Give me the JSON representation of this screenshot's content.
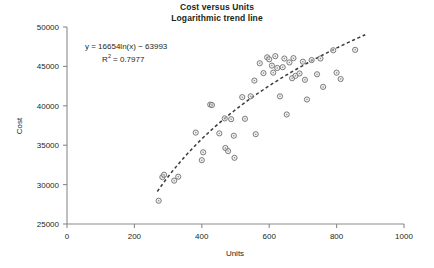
{
  "title": {
    "line1": "Cost versus Units",
    "line2": "Logarithmic trend line"
  },
  "annotation": {
    "equation": "y = 16654ln(x) − 63993",
    "r_squared": "R2 = 0.7977",
    "r_squared_base": "R",
    "r_squared_exp": "2",
    "r_squared_value": "= 0.7977"
  },
  "axes": {
    "x_label": "Units",
    "y_label": "Cost",
    "x_ticks": [
      "0",
      "200",
      "400",
      "600",
      "800",
      "1000"
    ],
    "y_ticks": [
      "25000",
      "30000",
      "35000",
      "40000",
      "45000",
      "50000"
    ]
  },
  "chart_data": {
    "type": "scatter",
    "xlabel": "Units",
    "ylabel": "Cost",
    "xlim": [
      0,
      1000
    ],
    "ylim": [
      25000,
      50000
    ],
    "xticks": [
      0,
      200,
      400,
      600,
      800,
      1000
    ],
    "yticks": [
      25000,
      30000,
      35000,
      40000,
      45000,
      50000
    ],
    "grid": false,
    "legend": false,
    "marker_style": "open-circle",
    "marker_color": "#6e6e6e",
    "trendline": {
      "type": "logarithmic",
      "equation": "y = 16654ln(x) - 63993",
      "coefficient": 16654,
      "intercept": -63993,
      "r_squared": 0.7977,
      "style": "dashed",
      "color": "#3a3a3a",
      "x_start": 268,
      "x_end": 885
    },
    "points": [
      {
        "x": 272,
        "y": 27950
      },
      {
        "x": 283,
        "y": 30950
      },
      {
        "x": 288,
        "y": 31250
      },
      {
        "x": 318,
        "y": 30500
      },
      {
        "x": 330,
        "y": 31000
      },
      {
        "x": 382,
        "y": 36600
      },
      {
        "x": 400,
        "y": 33100
      },
      {
        "x": 404,
        "y": 34100
      },
      {
        "x": 425,
        "y": 40150
      },
      {
        "x": 430,
        "y": 40100
      },
      {
        "x": 452,
        "y": 36500
      },
      {
        "x": 468,
        "y": 38400
      },
      {
        "x": 470,
        "y": 34650
      },
      {
        "x": 478,
        "y": 34250
      },
      {
        "x": 487,
        "y": 38300
      },
      {
        "x": 495,
        "y": 36200
      },
      {
        "x": 497,
        "y": 33400
      },
      {
        "x": 520,
        "y": 41100
      },
      {
        "x": 528,
        "y": 38350
      },
      {
        "x": 545,
        "y": 41200
      },
      {
        "x": 556,
        "y": 43200
      },
      {
        "x": 560,
        "y": 36400
      },
      {
        "x": 572,
        "y": 45400
      },
      {
        "x": 583,
        "y": 44150
      },
      {
        "x": 594,
        "y": 46150
      },
      {
        "x": 600,
        "y": 45900
      },
      {
        "x": 608,
        "y": 45100
      },
      {
        "x": 612,
        "y": 44200
      },
      {
        "x": 618,
        "y": 46300
      },
      {
        "x": 624,
        "y": 44800
      },
      {
        "x": 632,
        "y": 41200
      },
      {
        "x": 640,
        "y": 44900
      },
      {
        "x": 645,
        "y": 46000
      },
      {
        "x": 652,
        "y": 38900
      },
      {
        "x": 660,
        "y": 45500
      },
      {
        "x": 668,
        "y": 43500
      },
      {
        "x": 672,
        "y": 46050
      },
      {
        "x": 678,
        "y": 43800
      },
      {
        "x": 690,
        "y": 44100
      },
      {
        "x": 700,
        "y": 45600
      },
      {
        "x": 706,
        "y": 43300
      },
      {
        "x": 712,
        "y": 40800
      },
      {
        "x": 726,
        "y": 45800
      },
      {
        "x": 742,
        "y": 44000
      },
      {
        "x": 752,
        "y": 46000
      },
      {
        "x": 760,
        "y": 42400
      },
      {
        "x": 790,
        "y": 47050
      },
      {
        "x": 800,
        "y": 44200
      },
      {
        "x": 812,
        "y": 43400
      },
      {
        "x": 855,
        "y": 47100
      }
    ]
  }
}
